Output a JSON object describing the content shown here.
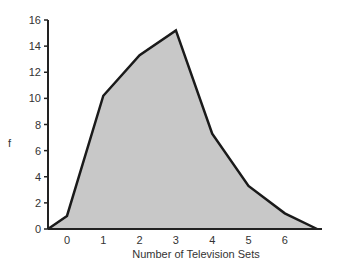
{
  "chart_data": {
    "type": "area",
    "title": "",
    "xlabel": "Number of Television Sets",
    "ylabel": "f",
    "x": [
      0,
      1,
      2,
      3,
      4,
      5,
      6
    ],
    "values": [
      1.0,
      10.2,
      13.3,
      15.2,
      7.3,
      3.3,
      1.2
    ],
    "polygon_endpoints": {
      "start": [
        -0.5,
        0
      ],
      "end": [
        7,
        0
      ]
    },
    "xticks": [
      "0",
      "1",
      "2",
      "3",
      "4",
      "5",
      "6"
    ],
    "yticks": [
      "0",
      "2",
      "4",
      "6",
      "8",
      "10",
      "12",
      "14",
      "16"
    ],
    "ylim": [
      0,
      16
    ],
    "grid": false,
    "legend": null,
    "fill_color": "#c8c8c8",
    "line_color": "#1a1a1a"
  }
}
